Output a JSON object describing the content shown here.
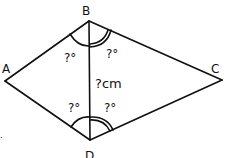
{
  "diagram": {
    "type": "kite / quadrilateral with diagonal",
    "vertices": {
      "A": {
        "label": "A",
        "x": 5,
        "y": 81
      },
      "B": {
        "label": "B",
        "x": 89,
        "y": 21
      },
      "C": {
        "label": "C",
        "x": 222,
        "y": 80
      },
      "D": {
        "label": "D",
        "x": 90,
        "y": 140
      }
    },
    "diagonal_label": "?cm",
    "angles": {
      "ABD": "?°",
      "DBC": "?°",
      "ADB": "?°",
      "BDC": "?°"
    },
    "stray_mark": "."
  }
}
